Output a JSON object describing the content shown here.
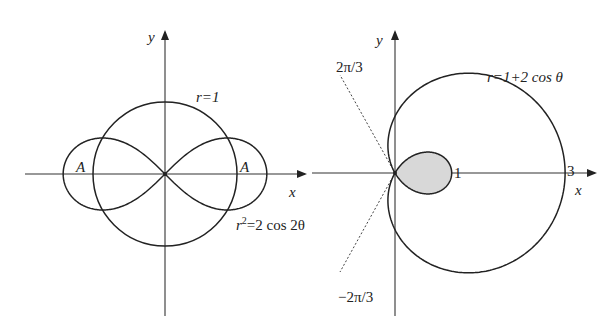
{
  "left_figure": {
    "origin": [
      165,
      174
    ],
    "unit_px": 72,
    "x_axis": {
      "from": 25,
      "to": 305,
      "label": "x"
    },
    "y_axis": {
      "from": 316,
      "to": 32,
      "label": "y"
    },
    "curves": [
      {
        "name": "circle",
        "equation": "r=1",
        "r": 1
      },
      {
        "name": "lemniscate",
        "equation": "r²=2 cos 2θ",
        "a2": 2
      }
    ],
    "labels": {
      "circle": "r=1",
      "lemniscate_r": "r",
      "lemniscate_sup": "2",
      "lemniscate_rest": "=2 cos 2θ",
      "region_left": "A",
      "region_right": "A",
      "x": "x",
      "y": "y"
    }
  },
  "right_figure": {
    "origin": [
      395,
      173
    ],
    "unit_px": 56.7,
    "x_axis": {
      "from": 312,
      "to": 595,
      "label": "x"
    },
    "y_axis": {
      "from": 316,
      "to": 32,
      "label": "y"
    },
    "curve": {
      "name": "limacon",
      "equation": "r=1+2 cos θ",
      "a": 1,
      "b": 2
    },
    "shaded_region": {
      "name": "inner-loop",
      "fill": "#d8d8d8"
    },
    "dashed_rays": [
      {
        "angle_label": "2π/3",
        "end": [
          340,
          75
        ]
      },
      {
        "angle_label": "−2π/3",
        "end": [
          340,
          272
        ]
      }
    ],
    "labels": {
      "curve": "r=1+2 cos θ",
      "tick_1": "1",
      "tick_3": "3",
      "angle_upper": "2π/3",
      "angle_lower": "−2π/3",
      "x": "x",
      "y": "y"
    }
  },
  "colors": {
    "stroke": "#222222",
    "shade": "#d8d8d8",
    "background": "#ffffff"
  }
}
